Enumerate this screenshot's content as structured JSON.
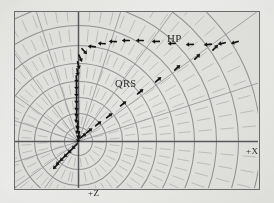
{
  "figure": {
    "title": "",
    "labels": {
      "hp": "HP",
      "qrs": "QRS",
      "axis_x": "+X",
      "axis_z": "+Z"
    },
    "colors": {
      "paper": "#e9e9e6",
      "panel": "#e4e4e1",
      "frame": "#6f6f72",
      "grid_arc": "#8e8e93",
      "grid_spoke": "#9a9a9e",
      "grid_tick": "#a8a8ac",
      "axis": "#5a5a5e",
      "marker": "#141414",
      "text": "#2a2a2a"
    }
  },
  "chart_data": {
    "type": "scatter",
    "xlabel": "+X",
    "ylabel": "+Z",
    "legend_position": "none",
    "grid": true,
    "coordinate_system": "polar",
    "origin_px": [
      79,
      142
    ],
    "axis_ranges": {
      "x_axis_label_at": "+X",
      "z_axis_label_at": "+Z"
    },
    "polar_grid": {
      "arc_radii": [
        14,
        28,
        44,
        60,
        78,
        96,
        116,
        138,
        160,
        182
      ],
      "spoke_angles_deg": [
        0,
        18,
        36,
        54,
        72,
        90,
        108,
        126,
        144,
        162,
        180,
        198,
        216,
        234
      ],
      "dashed_radial_ticks": true
    },
    "annotations": [
      {
        "text": "HP",
        "x_px": 152,
        "y_px": 20
      },
      {
        "text": "QRS",
        "x_px": 100,
        "y_px": 66
      },
      {
        "text": "+X",
        "x_px": 231,
        "y_px": 134
      },
      {
        "text": "+Z",
        "x_px": 73,
        "y_px": 176
      }
    ],
    "series": [
      {
        "name": "QRS loop (vertical ascending limb)",
        "marker": "arrow",
        "points": [
          {
            "x_px": 79,
            "y_px": 140,
            "angle_deg": 250
          },
          {
            "x_px": 79,
            "y_px": 136,
            "angle_deg": 255
          },
          {
            "x_px": 78,
            "y_px": 131,
            "angle_deg": 258
          },
          {
            "x_px": 78,
            "y_px": 126,
            "angle_deg": 260
          },
          {
            "x_px": 77,
            "y_px": 120,
            "angle_deg": 262
          },
          {
            "x_px": 77,
            "y_px": 114,
            "angle_deg": 264
          },
          {
            "x_px": 77,
            "y_px": 108,
            "angle_deg": 266
          },
          {
            "x_px": 77,
            "y_px": 101,
            "angle_deg": 268
          },
          {
            "x_px": 77,
            "y_px": 94,
            "angle_deg": 270
          },
          {
            "x_px": 77,
            "y_px": 87,
            "angle_deg": 272
          },
          {
            "x_px": 77,
            "y_px": 80,
            "angle_deg": 274
          },
          {
            "x_px": 78,
            "y_px": 73,
            "angle_deg": 278
          },
          {
            "x_px": 79,
            "y_px": 66,
            "angle_deg": 284
          },
          {
            "x_px": 81,
            "y_px": 59,
            "angle_deg": 294
          },
          {
            "x_px": 85,
            "y_px": 52,
            "angle_deg": 312
          }
        ]
      },
      {
        "name": "HP loop (upper arc, arrows pointing left)",
        "marker": "arrow",
        "points": [
          {
            "x_px": 92,
            "y_px": 47,
            "angle_deg": 175
          },
          {
            "x_px": 102,
            "y_px": 44,
            "angle_deg": 176
          },
          {
            "x_px": 113,
            "y_px": 42,
            "angle_deg": 178
          },
          {
            "x_px": 126,
            "y_px": 41,
            "angle_deg": 180
          },
          {
            "x_px": 140,
            "y_px": 41,
            "angle_deg": 180
          },
          {
            "x_px": 156,
            "y_px": 42,
            "angle_deg": 181
          },
          {
            "x_px": 172,
            "y_px": 44,
            "angle_deg": 182
          },
          {
            "x_px": 190,
            "y_px": 45,
            "angle_deg": 183
          },
          {
            "x_px": 208,
            "y_px": 45,
            "angle_deg": 186
          },
          {
            "x_px": 222,
            "y_px": 44,
            "angle_deg": 192
          },
          {
            "x_px": 235,
            "y_px": 43,
            "angle_deg": 196
          }
        ]
      },
      {
        "name": "Diagonal limb (return toward origin)",
        "marker": "arrow",
        "points": [
          {
            "x_px": 84,
            "y_px": 136,
            "angle_deg": 38
          },
          {
            "x_px": 90,
            "y_px": 131,
            "angle_deg": 38
          },
          {
            "x_px": 99,
            "y_px": 124,
            "angle_deg": 38
          },
          {
            "x_px": 110,
            "y_px": 116,
            "angle_deg": 38
          },
          {
            "x_px": 124,
            "y_px": 104,
            "angle_deg": 39
          },
          {
            "x_px": 141,
            "y_px": 92,
            "angle_deg": 40
          },
          {
            "x_px": 159,
            "y_px": 80,
            "angle_deg": 41
          },
          {
            "x_px": 178,
            "y_px": 68,
            "angle_deg": 42
          },
          {
            "x_px": 198,
            "y_px": 57,
            "angle_deg": 44
          },
          {
            "x_px": 216,
            "y_px": 48,
            "angle_deg": 46
          }
        ]
      },
      {
        "name": "Initial vector cluster at origin",
        "marker": "arrow",
        "points": [
          {
            "x_px": 75,
            "y_px": 147,
            "angle_deg": 225
          },
          {
            "x_px": 71,
            "y_px": 151,
            "angle_deg": 225
          },
          {
            "x_px": 67,
            "y_px": 155,
            "angle_deg": 225
          },
          {
            "x_px": 63,
            "y_px": 159,
            "angle_deg": 225
          },
          {
            "x_px": 59,
            "y_px": 163,
            "angle_deg": 225
          },
          {
            "x_px": 56,
            "y_px": 167,
            "angle_deg": 225
          }
        ]
      }
    ]
  }
}
